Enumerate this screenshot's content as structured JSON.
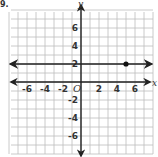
{
  "problem_number": "9.",
  "chart_data": {
    "type": "line",
    "title": "",
    "xlabel": "x",
    "ylabel": "y",
    "origin_label": "O",
    "xlim": [
      -8,
      8
    ],
    "ylim": [
      -8,
      8
    ],
    "grid": true,
    "x_tick_labels": [
      "-6",
      "-4",
      "-2",
      "2",
      "4",
      "6"
    ],
    "y_tick_labels": [
      "6",
      "4",
      "2",
      "-2",
      "-4",
      "-6"
    ],
    "x_ticks": [
      -6,
      -4,
      -2,
      2,
      4,
      6
    ],
    "y_ticks": [
      6,
      4,
      2,
      -2,
      -4,
      -6
    ],
    "series": [
      {
        "name": "horizontal line y = 2",
        "equation": "y = 2",
        "x": [
          -7.5,
          7.5
        ],
        "y": [
          2,
          2
        ],
        "arrows": "both"
      }
    ],
    "points": [
      {
        "x": 5,
        "y": 2,
        "label": ""
      }
    ],
    "colors": {
      "grid": "#bdbdbd",
      "axis": "#222222",
      "line": "#222222",
      "point": "#111111"
    }
  }
}
